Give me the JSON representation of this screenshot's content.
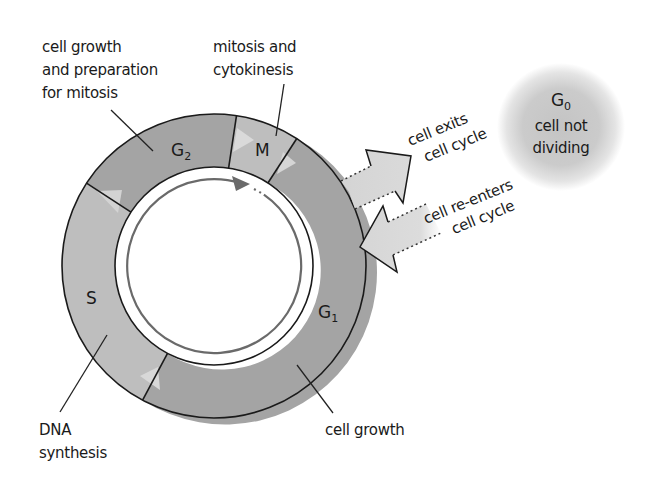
{
  "title": "Cell cycle",
  "colors": {
    "dark_segment": "#a4a4a4",
    "light_segment": "#bebebe",
    "triangle": "#d9d9d9",
    "outline": "#1a1a1a",
    "inner_arrow": "#6a6a6a",
    "cycle_arrow_fill": "#d6d6d6",
    "g0_fill": "#c9c9c9"
  },
  "phases": [
    {
      "id": "G1",
      "letter": "G",
      "subscript": "1",
      "start_deg": -57,
      "end_deg": 118,
      "shade": "dark"
    },
    {
      "id": "S",
      "letter": "S",
      "subscript": "",
      "start_deg": 118,
      "end_deg": 213,
      "shade": "light"
    },
    {
      "id": "G2",
      "letter": "G",
      "subscript": "2",
      "start_deg": 213,
      "end_deg": 278.5,
      "shade": "dark"
    },
    {
      "id": "M",
      "letter": "M",
      "subscript": "",
      "start_deg": 278.5,
      "end_deg": 303,
      "shade": "light"
    }
  ],
  "labels": {
    "g2_desc": [
      "cell growth",
      "and preparation",
      "for mitosis"
    ],
    "m_desc": [
      "mitosis and",
      "cytokinesis"
    ],
    "s_desc": [
      "DNA",
      "synthesis"
    ],
    "g1_desc": [
      "cell growth"
    ],
    "exit": [
      "cell exits",
      "cell cycle"
    ],
    "reenter": [
      "cell re-enters",
      "cell cycle"
    ]
  },
  "g0": {
    "letter": "G",
    "subscript": "0",
    "lines": [
      "cell not",
      "dividing"
    ]
  }
}
